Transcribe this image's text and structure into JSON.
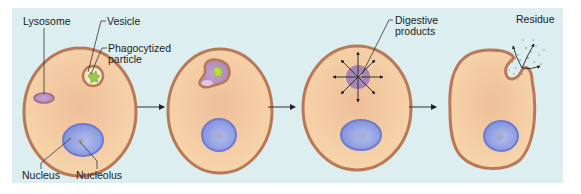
{
  "figure": {
    "stages": [
      {
        "id": 1,
        "description": "Vesicle containing phagocytized particle near lysosome"
      },
      {
        "id": 2,
        "description": "Lysosome fuses with vesicle"
      },
      {
        "id": 3,
        "description": "Digestion releases digestive products"
      },
      {
        "id": 4,
        "description": "Residue expelled by exocytosis"
      }
    ],
    "labels": {
      "lysosome": "Lysosome",
      "vesicle": "Vesicle",
      "phagocytized_line1": "Phagocytized",
      "phagocytized_line2": "particle",
      "nucleus": "Nucleus",
      "nucleolus": "Nucleolus",
      "digestive_line1": "Digestive",
      "digestive_line2": "products",
      "residue": "Residue"
    },
    "colors": {
      "panel_bg": "#dceef0",
      "cytoplasm": "#f3c9a0",
      "membrane": "#b97856",
      "nucleus": "#8f9ee0",
      "nucleus_edge": "#6b7cd0",
      "lysosome": "#b48ac4",
      "particle": "#9cc84a",
      "arrow": "#222222"
    }
  }
}
